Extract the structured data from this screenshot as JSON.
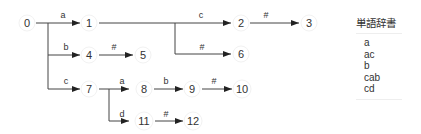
{
  "diagram": {
    "type": "trie",
    "nodes": [
      {
        "id": "0",
        "label": "0"
      },
      {
        "id": "1",
        "label": "1"
      },
      {
        "id": "2",
        "label": "2"
      },
      {
        "id": "3",
        "label": "3"
      },
      {
        "id": "4",
        "label": "4"
      },
      {
        "id": "5",
        "label": "5"
      },
      {
        "id": "6",
        "label": "6"
      },
      {
        "id": "7",
        "label": "7"
      },
      {
        "id": "8",
        "label": "8"
      },
      {
        "id": "9",
        "label": "9"
      },
      {
        "id": "10",
        "label": "10"
      },
      {
        "id": "11",
        "label": "11"
      },
      {
        "id": "12",
        "label": "12"
      }
    ],
    "edges": [
      {
        "from": "0",
        "to": "1",
        "label": "a"
      },
      {
        "from": "0",
        "to": "4",
        "label": "b"
      },
      {
        "from": "0",
        "to": "7",
        "label": "c"
      },
      {
        "from": "1",
        "to": "2",
        "label": "c"
      },
      {
        "from": "1",
        "to": "6",
        "label": "#"
      },
      {
        "from": "2",
        "to": "3",
        "label": "#"
      },
      {
        "from": "4",
        "to": "5",
        "label": "#"
      },
      {
        "from": "7",
        "to": "8",
        "label": "a"
      },
      {
        "from": "7",
        "to": "11",
        "label": "d"
      },
      {
        "from": "8",
        "to": "9",
        "label": "b"
      },
      {
        "from": "9",
        "to": "10",
        "label": "#"
      },
      {
        "from": "11",
        "to": "12",
        "label": "#"
      }
    ]
  },
  "dictionary": {
    "title": "単語辞書",
    "words": [
      "a",
      "ac",
      "b",
      "cab",
      "cd"
    ]
  }
}
